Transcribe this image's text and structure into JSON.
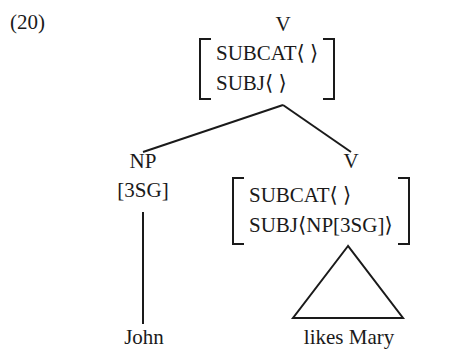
{
  "example": {
    "number_label": "(20)"
  },
  "tree": {
    "root": {
      "category": "V",
      "matrix": {
        "rows": [
          {
            "attribute": "SUBCAT",
            "value": "⟨ ⟩",
            "text": "SUBCAT⟨ ⟩"
          },
          {
            "attribute": "SUBJ",
            "value": "⟨ ⟩",
            "text": "SUBJ⟨ ⟩"
          }
        ],
        "bracket_left": "[",
        "bracket_right": "]"
      }
    },
    "left_daughter": {
      "category": "NP",
      "feature": "[3SG]",
      "terminal": "John"
    },
    "right_daughter": {
      "category": "V",
      "matrix": {
        "rows": [
          {
            "attribute": "SUBCAT",
            "value": "⟨ ⟩",
            "text": "SUBCAT⟨ ⟩"
          },
          {
            "attribute": "SUBJ",
            "value": "⟨NP[3SG]⟩",
            "text": "SUBJ⟨NP[3SG]⟩"
          }
        ],
        "bracket_left": "[",
        "bracket_right": "]"
      },
      "triangle": "phrase-triangle",
      "terminal": "likes Mary"
    }
  },
  "style": {
    "ink": "#1a1a1a",
    "background": "#ffffff",
    "line_width": 2
  }
}
